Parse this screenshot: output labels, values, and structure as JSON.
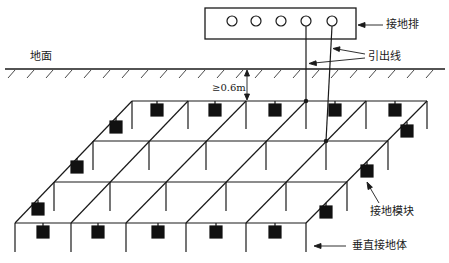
{
  "diagram": {
    "type": "grounding-grid-schematic",
    "labels": {
      "ground_surface": "地面",
      "busbar": "接地排",
      "lead_wire": "引出线",
      "depth": "≥0.6m",
      "grounding_module": "接地模块",
      "vertical_electrode": "垂直接地体"
    },
    "busbar": {
      "hole_count": 5
    },
    "grid": {
      "rows": 4,
      "columns": 5,
      "module_count": 16,
      "lead_wire_count": 2
    },
    "colors": {
      "line": "#1a1a1a",
      "module": "#111111",
      "background": "#ffffff"
    }
  }
}
